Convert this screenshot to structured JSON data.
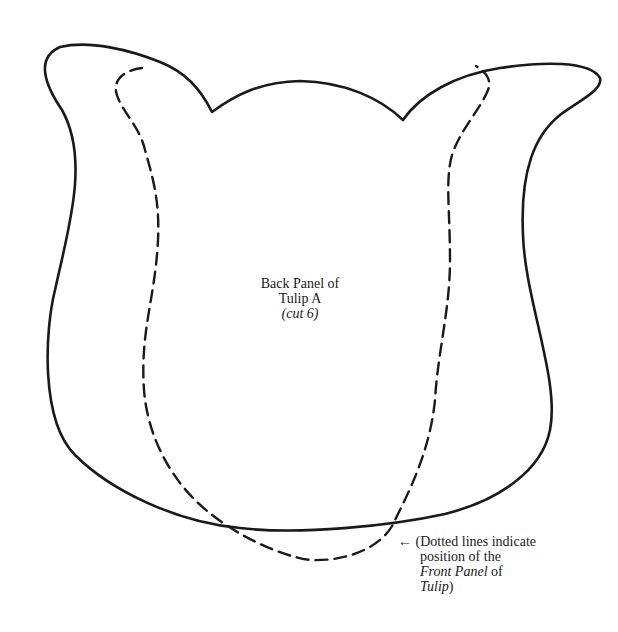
{
  "pattern": {
    "title_line1": "Back Panel of",
    "title_line2": "Tulip A",
    "title_line3": "(cut 6)"
  },
  "note": {
    "arrow": "←",
    "line1": "(Dotted lines indicate",
    "line2": "position of the",
    "line3_italic": "Front Panel",
    "line3_rest": " of",
    "line4_italic": "Tulip",
    "line4_rest": ")"
  },
  "colors": {
    "line": "#1a1a1a",
    "background": "#ffffff"
  }
}
